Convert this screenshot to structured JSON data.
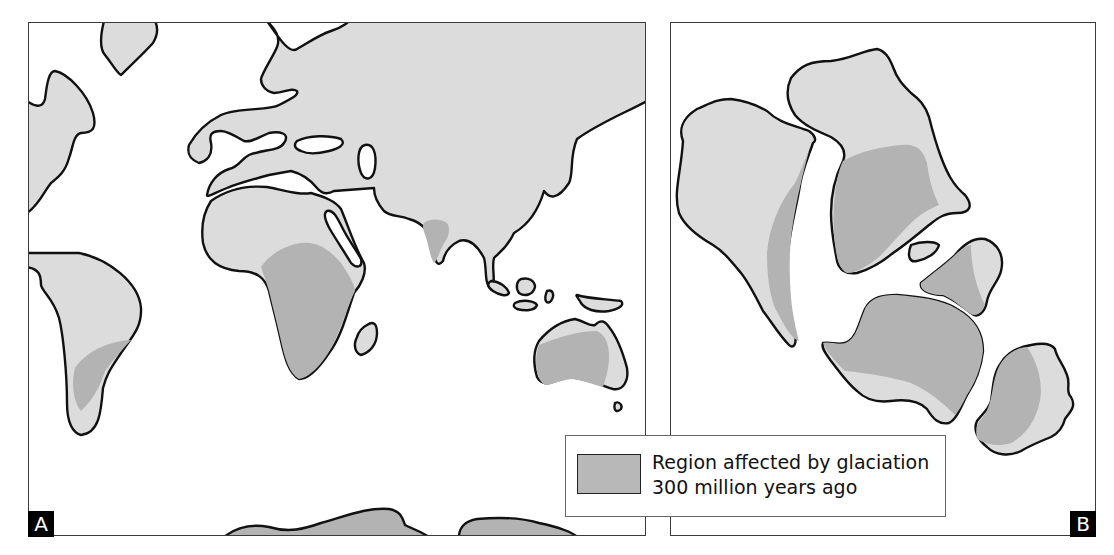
{
  "figure": {
    "panels": [
      {
        "id": "A",
        "label": "A",
        "description": "Present-day continents with regions glaciated 300 million years ago"
      },
      {
        "id": "B",
        "label": "B",
        "description": "Southern continents reassembled into Gondwana showing contiguous glaciated region"
      }
    ],
    "legend": {
      "swatch_color": "#b8b8b8",
      "line1": "Region affected by glaciation",
      "line2": "300 million years ago"
    },
    "colors": {
      "land": "#dcdcdc",
      "glaciated": "#b3b3b3",
      "outline": "#111111",
      "ocean": "#ffffff"
    }
  }
}
